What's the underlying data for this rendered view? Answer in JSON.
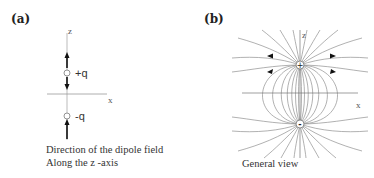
{
  "panel_a": {
    "label": "(a)",
    "z_axis_label": "z",
    "x_axis_label": "x",
    "positive_charge_label": "+q",
    "negative_charge_label": "-q",
    "caption_line1": "Direction of the dipole field",
    "caption_line2": "Along the z -axis"
  },
  "panel_b": {
    "label": "(b)",
    "z_axis_label": "z",
    "x_axis_label": "x",
    "positive_charge_symbol": "+",
    "negative_charge_symbol": "-",
    "caption": "General view"
  },
  "colors": {
    "axis": "#999999",
    "field_line": "#8a8a8a",
    "arrow": "#111111",
    "text": "#222222"
  }
}
